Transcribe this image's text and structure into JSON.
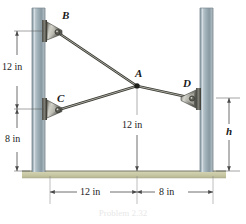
{
  "figure": {
    "caption": "Problem 2.32",
    "ground_color": "#c9c9a8",
    "pole_color": "#a7b6bd",
    "cable_color": "#6e6e66",
    "dim_color": "#4a4a4a"
  },
  "points": [
    {
      "id": "B",
      "label": "B",
      "x": 62,
      "y": 16
    },
    {
      "id": "C",
      "label": "C",
      "x": 58,
      "y": 99
    },
    {
      "id": "A",
      "label": "A",
      "x": 138,
      "y": 74
    },
    {
      "id": "D",
      "label": "D",
      "x": 184,
      "y": 84
    }
  ],
  "dimensions": {
    "left_upper": "12 in",
    "left_lower": "8 in",
    "center_vertical": "12 in",
    "bottom_left": "12 in",
    "bottom_right": "8 in",
    "right_height": "h"
  },
  "geometry": {
    "left_pole": {
      "x": 32,
      "width": 13,
      "top": 8,
      "bottom": 172
    },
    "right_pole": {
      "x": 200,
      "width": 13,
      "top": 8,
      "bottom": 172
    },
    "anchor_B": {
      "x": 48,
      "y": 30
    },
    "anchor_C": {
      "x": 48,
      "y": 108
    },
    "anchor_D": {
      "x": 198,
      "y": 97
    },
    "joint_A": {
      "x": 137,
      "y": 86
    },
    "ground_y": 171
  }
}
